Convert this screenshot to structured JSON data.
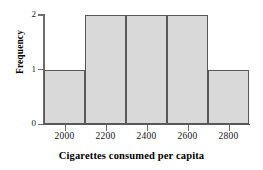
{
  "chart_data": {
    "type": "bar",
    "title": "",
    "xlabel": "Cigarettes consumed per capita",
    "ylabel": "Frequency",
    "bin_edges": [
      1900,
      2100,
      2300,
      2500,
      2700,
      2900
    ],
    "bin_width": 200,
    "categories": [
      "1900-2100",
      "2100-2300",
      "2300-2500",
      "2500-2700",
      "2700-2900"
    ],
    "values": [
      1,
      2,
      2,
      2,
      1
    ],
    "x_ticks": [
      2000,
      2200,
      2400,
      2600,
      2800
    ],
    "x_tick_labels": [
      "2000",
      "2200",
      "2400",
      "2600",
      "2800"
    ],
    "y_ticks": [
      0,
      1,
      2
    ],
    "y_tick_labels": [
      "0",
      "1",
      "2"
    ],
    "xlim": [
      1900,
      2900
    ],
    "ylim": [
      0,
      2
    ],
    "grid": false,
    "legend": false,
    "bar_fill_color": "#d9d9d9",
    "bar_edge_color": "#585858",
    "axis_color": "#6d6d6d",
    "background_color": "#ffffff"
  },
  "axis": {
    "x_title": "Cigarettes consumed per capita",
    "y_title": "Frequency"
  }
}
